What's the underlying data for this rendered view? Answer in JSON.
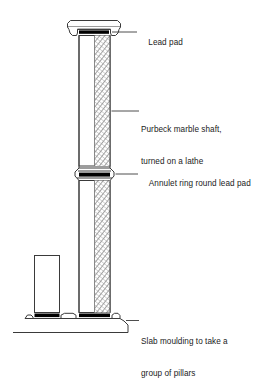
{
  "figure": {
    "type": "technical-line-drawing",
    "background_color": "#ffffff",
    "line_color": "#3a3a3a",
    "lead_pad_color": "#000000",
    "hatch_color": "#7a7a7a",
    "text_color": "#1b1b1b"
  },
  "labels": {
    "lead_pad": "Lead pad",
    "shaft_line1": "Purbeck marble shaft,",
    "shaft_line2": "turned on a lathe",
    "annulet": "Annulet ring round lead pad",
    "slab_line1": "Slab moulding to take a",
    "slab_line2": "group of pillars"
  },
  "parts": {
    "capital": "capital-abacus-moulding",
    "lead_pad_top": "lead-pad-under-capital",
    "shaft": "purbeck-marble-shaft",
    "annulet_ring": "annulet-ring",
    "lead_pad_middle": "lead-pad-at-annulet",
    "lead_pad_base": "lead-pad-on-slab",
    "secondary_pillar": "adjacent-pillar-outline",
    "slab_moulding": "slab-moulding-base",
    "ground_line": "ground-line"
  }
}
